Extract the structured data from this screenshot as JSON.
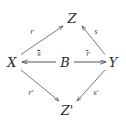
{
  "figure": {
    "type": "commutative-diagram",
    "background_color": "#ffffff",
    "stroke_color": "#4a4a4a",
    "text_color": "#2b2b2b"
  },
  "vertices": {
    "z_top": "Z",
    "x_left": "X",
    "b_center": "B",
    "y_right": "Y",
    "z_prime_bottom": "Z'"
  },
  "edges": {
    "x_to_z": {
      "label": "r",
      "from": "X",
      "to": "Z"
    },
    "y_to_z": {
      "label": "s",
      "from": "Y",
      "to": "Z"
    },
    "b_to_x": {
      "label": "s",
      "label_accent": "bar",
      "from": "B",
      "to": "X"
    },
    "b_to_y": {
      "label": "r",
      "label_accent": "bar",
      "from": "B",
      "to": "Y"
    },
    "x_to_zprime": {
      "label": "r'",
      "from": "X",
      "to": "Z'"
    },
    "y_to_zprime": {
      "label": "s'",
      "from": "Y",
      "to": "Z'"
    }
  }
}
